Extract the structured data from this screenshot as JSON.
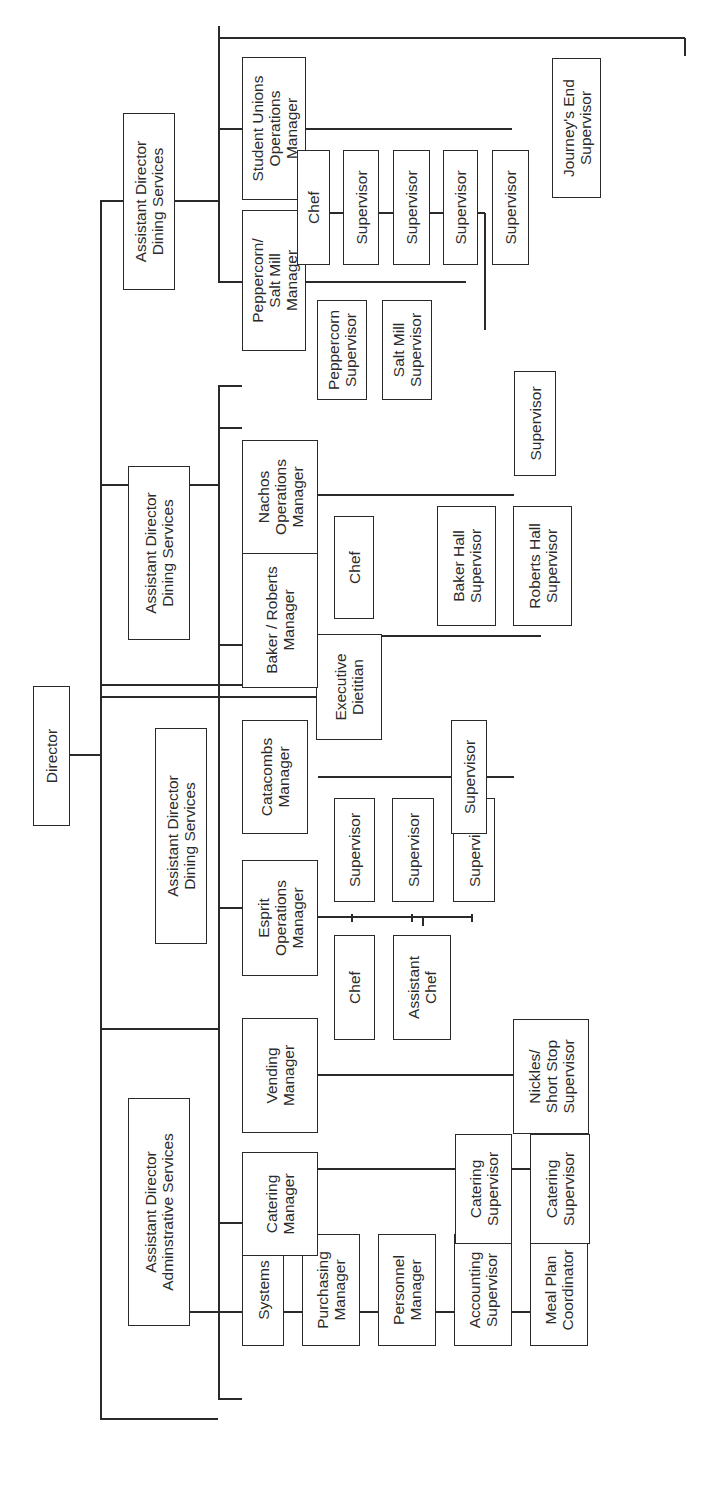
{
  "chart": {
    "type": "org-chart",
    "orientation": "rotated-90-ccw",
    "nodes": {
      "director": "Director",
      "ad_admin": "Assistant Director\nAdminstrative Services",
      "systems": "Systems",
      "purchasing": "Purchasing\nManager",
      "personnel": "Personnel\nManager",
      "accounting": "Accounting\nSupervisor",
      "meal_plan": "Meal Plan\nCoordinator",
      "ad_dining_1": "Assistant Director\nDining Services",
      "catering_mgr": "Catering\nManager",
      "catering_sup_1": "Catering\nSupervisor",
      "catering_sup_2": "Catering\nSupervisor",
      "vending_mgr": "Vending\nManager",
      "nickles_sup": "Nickles/\nShort Stop\nSupervisor",
      "esprit_mgr": "Esprit\nOperations\nManager",
      "esprit_chef": "Chef",
      "esprit_asst_chef": "Assistant\nChef",
      "esprit_sup_1": "Supervisor",
      "esprit_sup_2": "Supervisor",
      "esprit_sup_3": "Supervisor",
      "catacombs_mgr": "Catacombs\nManager",
      "catacombs_sup": "Supervisor",
      "exec_dietitian": "Executive\nDietitian",
      "ad_dining_2": "Assistant Director\nDining Services",
      "baker_roberts_mgr": "Baker / Roberts\nManager",
      "baker_hall_sup": "Baker Hall\nSupervisor",
      "roberts_hall_sup": "Roberts Hall\nSupervisor",
      "nachos_mgr": "Nachos\nOperations\nManager",
      "nachos_chef": "Chef",
      "nachos_sup": "Supervisor",
      "ad_dining_3": "Assistant Director\nDining Services",
      "peppercorn_mgr": "Peppercorn/\nSalt Mill\nManager",
      "peppercorn_sup": "Peppercorn\nSupervisor",
      "saltmill_sup": "Salt Mill\nSupervisor",
      "unions_mgr": "Student Unions\nOperations\nManager",
      "unions_chef": "Chef",
      "unions_sup_1": "Supervisor",
      "unions_sup_2": "Supervisor",
      "unions_sup_3": "Supervisor",
      "unions_sup_4": "Supervisor",
      "journeys_end_sup": "Journey's End\nSupervisor"
    }
  }
}
